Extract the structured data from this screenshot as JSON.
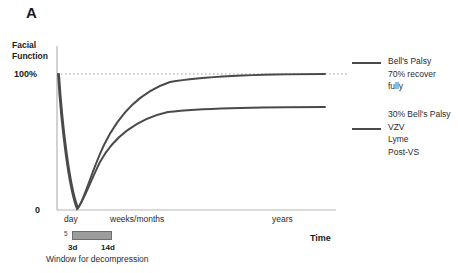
{
  "figure": {
    "panel_label": "A",
    "y_axis_title": "Facial\nFunction",
    "y_tick_top": "100%",
    "y_tick_bottom": "0",
    "x_axis_title": "Time",
    "x_labels": {
      "day": "day",
      "weeks_months": "weeks/months",
      "years": "years"
    },
    "decompression_window": {
      "start_marker": "5",
      "tick_left": "3d",
      "tick_right": "14d",
      "caption": "Window for decompression",
      "bar_color": "#9c9c9c",
      "bar_border_color": "#6e6e6e"
    },
    "legend": [
      {
        "name": "legend-bells-palsy-recover",
        "text": "Bell's Palsy\n70% recover\nfully",
        "color": "#4a4a4a"
      },
      {
        "name": "legend-incomplete-recovery",
        "text": "30% Bell's Palsy\nVZV\nLyme\nPost-VS",
        "color": "#4a4a4a"
      }
    ]
  },
  "chart_data": {
    "type": "line",
    "title": "",
    "xlabel": "Time",
    "ylabel": "Facial Function",
    "xlim": [
      0,
      100
    ],
    "ylim": [
      0,
      100
    ],
    "grid": false,
    "reference_lines": [
      {
        "name": "100-percent-dotted",
        "axis": "y",
        "value": 100,
        "style": "dotted"
      }
    ],
    "x_tick_labels": [
      "day",
      "weeks/months",
      "years"
    ],
    "y_tick_labels": [
      "0",
      "100%"
    ],
    "legend_position": "right",
    "annotations": [
      {
        "text": "Window for decompression",
        "x_range": [
          3,
          14
        ],
        "unit": "days"
      },
      {
        "text": "3d",
        "x": 3
      },
      {
        "text": "14d",
        "x": 14
      }
    ],
    "x": [
      0,
      2,
      4,
      6,
      8,
      10,
      12,
      15,
      20,
      26,
      33,
      42,
      52,
      64,
      78,
      92,
      100
    ],
    "series": [
      {
        "name": "Bell's Palsy 70% recover fully",
        "color": "#4a4a4a",
        "values": [
          100,
          62,
          24,
          2,
          0,
          12,
          30,
          52,
          70,
          82,
          89,
          94,
          97,
          99,
          100,
          100,
          100
        ]
      },
      {
        "name": "30% Bell's Palsy / VZV / Lyme / Post-VS",
        "color": "#4a4a4a",
        "values": [
          100,
          60,
          22,
          1,
          0,
          9,
          21,
          34,
          44,
          51,
          55,
          57,
          59,
          60,
          60,
          60,
          60
        ]
      }
    ]
  }
}
